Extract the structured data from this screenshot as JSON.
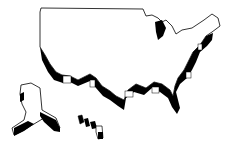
{
  "illustration": {
    "subject": "3D extruded outline map of the United States",
    "regions": [
      "contiguous-us",
      "alaska",
      "hawaii"
    ],
    "colors": {
      "background": "#ffffff",
      "outline": "#000000",
      "fill": "#ffffff",
      "extrusion": "#000000"
    }
  }
}
